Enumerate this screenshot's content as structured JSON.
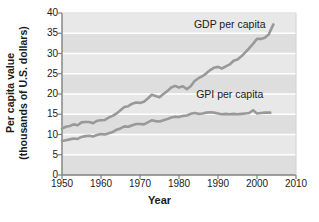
{
  "chart_data": {
    "type": "line",
    "title": "",
    "xlabel": "Year",
    "ylabel_line1": "Per capita value",
    "ylabel_line2": "(thousands of U.S. dollars)",
    "xlim": [
      1950,
      2010
    ],
    "ylim": [
      0,
      40
    ],
    "xticks": [
      1950,
      1960,
      1970,
      1980,
      1990,
      2000,
      2010
    ],
    "xtick_labels": [
      "1950",
      "1960",
      "1970",
      "1980",
      "1990",
      "2000",
      "2010"
    ],
    "yticks": [
      0,
      5,
      10,
      15,
      20,
      25,
      30,
      35,
      40
    ],
    "ytick_labels": [
      "0",
      "5",
      "10",
      "15",
      "20",
      "25",
      "30",
      "35",
      "40"
    ],
    "grid": true,
    "grid_orientation": "horizontal",
    "legend_position": "inline-annotation",
    "plot_bg": "#e8e8e8",
    "band_bg": "#dedede",
    "grid_color": "#ffffff",
    "line_color": "#999999",
    "axis_color": "#808080",
    "text_color": "#1b1b1b",
    "annotations": [
      {
        "text": "GDP per capita",
        "x": 1993,
        "y": 36.2
      },
      {
        "text": "GPI per capita",
        "x": 1993,
        "y": 19.0
      }
    ],
    "series": [
      {
        "name": "GDP per capita",
        "color": "#999999",
        "x": [
          1950,
          1951,
          1952,
          1953,
          1954,
          1955,
          1956,
          1957,
          1958,
          1959,
          1960,
          1961,
          1962,
          1963,
          1964,
          1965,
          1966,
          1967,
          1968,
          1969,
          1970,
          1971,
          1972,
          1973,
          1974,
          1975,
          1976,
          1977,
          1978,
          1979,
          1980,
          1981,
          1982,
          1983,
          1984,
          1985,
          1986,
          1987,
          1988,
          1989,
          1990,
          1991,
          1992,
          1993,
          1994,
          1995,
          1996,
          1997,
          1998,
          1999,
          2000,
          2001,
          2002,
          2003
        ],
        "values": [
          11.5,
          11.9,
          12.1,
          12.5,
          12.3,
          13.0,
          13.1,
          13.1,
          12.8,
          13.4,
          13.5,
          13.6,
          14.2,
          14.6,
          15.2,
          16.0,
          16.8,
          17.0,
          17.6,
          17.9,
          17.8,
          18.1,
          18.9,
          19.8,
          19.5,
          19.2,
          20.0,
          20.7,
          21.6,
          22.0,
          21.6,
          21.9,
          21.2,
          21.9,
          23.2,
          23.9,
          24.4,
          25.1,
          25.9,
          26.5,
          26.7,
          26.3,
          26.8,
          27.3,
          28.2,
          28.5,
          29.3,
          30.3,
          31.3,
          32.4,
          33.6,
          33.6,
          33.9,
          34.7
        ],
        "end_value": 37.2
      },
      {
        "name": "GPI per capita",
        "color": "#999999",
        "x": [
          1950,
          1951,
          1952,
          1953,
          1954,
          1955,
          1956,
          1957,
          1958,
          1959,
          1960,
          1961,
          1962,
          1963,
          1964,
          1965,
          1966,
          1967,
          1968,
          1969,
          1970,
          1971,
          1972,
          1973,
          1974,
          1975,
          1976,
          1977,
          1978,
          1979,
          1980,
          1981,
          1982,
          1983,
          1984,
          1985,
          1986,
          1987,
          1988,
          1989,
          1990,
          1991,
          1992,
          1993,
          1994,
          1995,
          1996,
          1997,
          1998,
          1999,
          2000,
          2001,
          2002,
          2003
        ],
        "values": [
          8.4,
          8.6,
          8.8,
          9.0,
          8.9,
          9.4,
          9.6,
          9.7,
          9.5,
          9.9,
          10.1,
          10.0,
          10.3,
          10.6,
          11.2,
          11.5,
          12.0,
          11.9,
          12.3,
          12.6,
          12.6,
          12.5,
          13.0,
          13.5,
          13.3,
          13.2,
          13.5,
          13.8,
          14.2,
          14.4,
          14.3,
          14.6,
          14.7,
          15.1,
          15.3,
          15.1,
          15.2,
          15.4,
          15.5,
          15.4,
          15.2,
          15.0,
          15.1,
          15.0,
          15.1,
          15.0,
          15.1,
          15.2,
          15.3,
          16.0,
          15.2,
          15.3,
          15.4,
          15.4
        ],
        "end_value": 15.4
      }
    ]
  }
}
